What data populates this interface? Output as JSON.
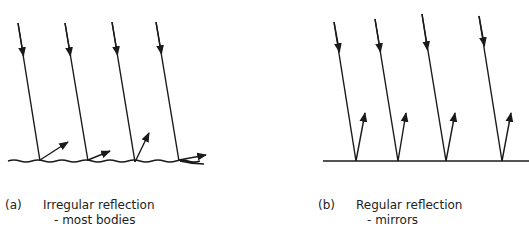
{
  "panels": [
    {
      "id": "a",
      "tag": "(a)",
      "title": "Irregular reflection",
      "subtitle": "- most bodies",
      "surface": "rough",
      "rays": [
        {
          "incident": [
            [
              18,
              23
            ],
            [
              40,
              161
            ]
          ],
          "reflected": [
            [
              40,
              160
            ],
            [
              68,
              142
            ]
          ]
        },
        {
          "incident": [
            [
              65,
              23
            ],
            [
              88,
              161
            ]
          ],
          "reflected": [
            [
              88,
              160
            ],
            [
              110,
              151
            ]
          ]
        },
        {
          "incident": [
            [
              112,
              22
            ],
            [
              135,
              162
            ]
          ],
          "reflected": [
            [
              135,
              162
            ],
            [
              149,
              133
            ]
          ]
        },
        {
          "incident": [
            [
              156,
              22
            ],
            [
              179,
              161
            ]
          ],
          "reflected": [
            [
              179,
              160
            ],
            [
              206,
              155
            ]
          ]
        }
      ]
    },
    {
      "id": "b",
      "tag": "(b)",
      "title": "Regular reflection",
      "subtitle": "- mirrors",
      "surface": "flat",
      "rays": [
        {
          "incident": [
            [
              334,
              22
            ],
            [
              356,
              161
            ]
          ],
          "reflected": [
            [
              356,
              161
            ],
            [
              365,
              113
            ]
          ]
        },
        {
          "incident": [
            [
              375,
              19
            ],
            [
              398,
              161
            ]
          ],
          "reflected": [
            [
              398,
              161
            ],
            [
              406,
              113
            ]
          ]
        },
        {
          "incident": [
            [
              422,
              14
            ],
            [
              446,
              161
            ]
          ],
          "reflected": [
            [
              446,
              161
            ],
            [
              455,
              113
            ]
          ]
        },
        {
          "incident": [
            [
              479,
              16
            ],
            [
              502,
              161
            ]
          ],
          "reflected": [
            [
              502,
              161
            ],
            [
              511,
              113
            ]
          ]
        }
      ]
    }
  ],
  "colors": {
    "line": "#1a1a1a",
    "background": "#ffffff"
  }
}
